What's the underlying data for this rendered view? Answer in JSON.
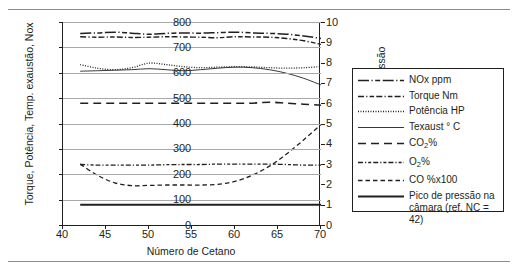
{
  "figure": {
    "rule_top": "horizontal-rule",
    "rule_bottom": "horizontal-rule"
  },
  "axes": {
    "x_title": "Número de Cetano",
    "x_ticks": [
      "40",
      "45",
      "50",
      "55",
      "60",
      "65",
      "70"
    ],
    "y_left_title_parts": [
      "Torque, Potência, Temp. exaustão, Nox"
    ],
    "y_left_ticks": [
      "0",
      "100",
      "200",
      "300",
      "400",
      "500",
      "600",
      "700",
      "800"
    ],
    "y_right_title_parts": [
      "CO",
      "2",
      ", O",
      "2",
      ", CO, Pico de pressão"
    ],
    "y_right_ticks": [
      "0",
      "1",
      "2",
      "3",
      "4",
      "5",
      "6",
      "7",
      "8",
      "9",
      "10"
    ]
  },
  "legend": {
    "items": [
      {
        "label": "NOx ppm",
        "style": "long-dash-dot-dot"
      },
      {
        "label": "Torque Nm",
        "style": "dash-dot-dot"
      },
      {
        "label": "Potência HP",
        "style": "dotted"
      },
      {
        "label": "Texaust ° C",
        "style": "solid-thin"
      },
      {
        "label_parts": [
          "CO",
          "2",
          "%"
        ],
        "label": "CO2%",
        "style": "long-dash"
      },
      {
        "label_parts": [
          "O",
          "2",
          "%"
        ],
        "label": "O2%",
        "style": "dash-dot"
      },
      {
        "label": "CO %x100",
        "style": "dashed"
      },
      {
        "label": "Pico de pressão na câmara (ref. NC = 42)",
        "style": "solid-thick"
      }
    ]
  },
  "chart_data": {
    "type": "line",
    "title": "",
    "xlabel": "Número de Cetano",
    "ylabel": "Torque, Potência, Temp. exaustão, Nox",
    "y2label": "CO2, O2, CO, Pico de pressão",
    "xlim": [
      40,
      70
    ],
    "ylim": [
      0,
      800
    ],
    "y2lim": [
      0,
      10
    ],
    "grid": true,
    "legend_position": "right-outside",
    "x": [
      42,
      44,
      46,
      48,
      50,
      52,
      54,
      56,
      58,
      60,
      62,
      64,
      66,
      68,
      70
    ],
    "series": [
      {
        "name": "NOx ppm",
        "axis": "left",
        "style": "long-dash-dot-dot",
        "values": [
          755,
          757,
          760,
          756,
          752,
          755,
          757,
          756,
          758,
          760,
          757,
          755,
          752,
          745,
          735
        ]
      },
      {
        "name": "Torque Nm",
        "axis": "left",
        "style": "dash-dot-dot",
        "values": [
          742,
          740,
          741,
          739,
          740,
          742,
          741,
          740,
          738,
          742,
          741,
          740,
          735,
          726,
          712
        ]
      },
      {
        "name": "Potência HP",
        "axis": "left",
        "style": "dotted",
        "values": [
          632,
          618,
          612,
          620,
          638,
          632,
          624,
          620,
          622,
          624,
          623,
          620,
          618,
          620,
          624
        ]
      },
      {
        "name": "Texaust ° C",
        "axis": "left",
        "style": "solid-thin",
        "values": [
          606,
          608,
          610,
          612,
          616,
          612,
          608,
          612,
          618,
          622,
          620,
          612,
          598,
          578,
          552
        ]
      },
      {
        "name": "CO2%",
        "axis": "right",
        "style": "long-dash",
        "values": [
          6.0,
          6.0,
          6.0,
          6.0,
          6.0,
          6.0,
          6.0,
          6.0,
          6.0,
          6.0,
          6.0,
          6.05,
          6.0,
          5.95,
          5.9
        ]
      },
      {
        "name": "O2%",
        "axis": "right",
        "style": "dash-dot",
        "values": [
          2.98,
          2.95,
          2.95,
          2.95,
          2.95,
          2.97,
          2.98,
          2.98,
          3.0,
          3.0,
          3.0,
          3.0,
          2.98,
          2.95,
          2.95
        ]
      },
      {
        "name": "CO %x100",
        "axis": "right",
        "style": "dashed",
        "values": [
          3.0,
          2.45,
          2.08,
          1.94,
          1.95,
          1.97,
          1.97,
          1.97,
          2.0,
          2.15,
          2.45,
          2.9,
          3.5,
          4.2,
          4.95
        ]
      },
      {
        "name": "Pico de pressão na câmara (ref. NC = 42)",
        "axis": "right",
        "style": "solid-thick",
        "values": [
          1.0,
          1.0,
          1.0,
          1.0,
          1.0,
          1.0,
          1.0,
          1.0,
          1.0,
          1.0,
          1.0,
          1.0,
          1.0,
          1.0,
          1.0
        ]
      }
    ]
  }
}
